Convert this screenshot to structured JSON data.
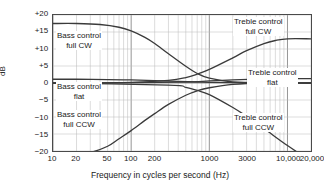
{
  "chart_data": {
    "type": "line",
    "title": "",
    "xlabel": "Frequency in cycles per second (Hz)",
    "ylabel": "dB",
    "xscale": "log",
    "xlim": [
      10,
      20000
    ],
    "ylim": [
      -20,
      20
    ],
    "grid": true,
    "legend_position": "inline-annotations",
    "x_ticks": [
      {
        "value": 10,
        "label": "10"
      },
      {
        "value": 20,
        "label": "20"
      },
      {
        "value": 50,
        "label": "50"
      },
      {
        "value": 100,
        "label": "100"
      },
      {
        "value": 200,
        "label": "200"
      },
      {
        "value": 1000,
        "label": "1000"
      },
      {
        "value": 3000,
        "label": "3000"
      },
      {
        "value": 10000,
        "label": "10,000"
      },
      {
        "value": 20000,
        "label": "20,000"
      }
    ],
    "y_ticks": [
      {
        "value": 20,
        "label": "+20"
      },
      {
        "value": 15,
        "label": "+15"
      },
      {
        "value": 10,
        "label": "+10"
      },
      {
        "value": 5,
        "label": "+5"
      },
      {
        "value": 0,
        "label": "0"
      },
      {
        "value": -5,
        "label": "−5"
      },
      {
        "value": -10,
        "label": "−10"
      },
      {
        "value": -15,
        "label": "−15"
      },
      {
        "value": -20,
        "label": "−20"
      }
    ],
    "series": [
      {
        "name": "Bass control full CW",
        "label_line1": "Bass control",
        "label_line2": "full CW",
        "x": [
          10,
          20,
          40,
          70,
          100,
          150,
          200,
          300,
          500,
          700,
          1000,
          2000,
          5000,
          20000
        ],
        "y": [
          17.5,
          17.5,
          17.2,
          16.4,
          15.3,
          13.4,
          11.6,
          8.6,
          4.9,
          2.8,
          1.4,
          0.3,
          0.0,
          0.0
        ]
      },
      {
        "name": "Bass control flat",
        "label_line1": "Bass control",
        "label_line2": "flat",
        "x": [
          10,
          20,
          50,
          100,
          200,
          400,
          700,
          1000,
          3000,
          20000
        ],
        "y": [
          1.1,
          1.1,
          1.0,
          0.9,
          0.7,
          0.5,
          0.3,
          0.2,
          0.1,
          0.0
        ]
      },
      {
        "name": "Bass control full CCW",
        "label_line1": "Bass control",
        "label_line2": "full CCW",
        "x": [
          10,
          20,
          30,
          50,
          70,
          100,
          150,
          200,
          300,
          500,
          700,
          1000,
          2000,
          5000,
          20000
        ],
        "y": [
          -20.5,
          -20.5,
          -20.4,
          -18.6,
          -16.4,
          -14.0,
          -11.0,
          -9.0,
          -6.3,
          -3.6,
          -2.3,
          -1.4,
          -0.4,
          0.0,
          0.0
        ]
      },
      {
        "name": "Treble control full CW",
        "label_line1": "Treble control",
        "label_line2": "full CW",
        "x": [
          10,
          100,
          300,
          500,
          700,
          1000,
          2000,
          3000,
          5000,
          7000,
          10000,
          20000
        ],
        "y": [
          0.0,
          0.2,
          0.8,
          1.6,
          2.6,
          4.0,
          7.4,
          9.5,
          11.6,
          12.5,
          13.0,
          13.0
        ]
      },
      {
        "name": "Treble control flat",
        "label_line1": "Treble control",
        "label_line2": "flat",
        "x": [
          10,
          100,
          500,
          1000,
          2000,
          5000,
          10000,
          20000
        ],
        "y": [
          0.0,
          0.1,
          0.3,
          0.6,
          0.9,
          1.2,
          1.3,
          1.3
        ]
      },
      {
        "name": "Treble control full CCW",
        "label_line1": "Treble control",
        "label_line2": "full CCW",
        "x": [
          10,
          300,
          500,
          700,
          1000,
          2000,
          3000,
          5000,
          10000,
          15000,
          20000
        ],
        "y": [
          0.0,
          -0.6,
          -1.3,
          -2.2,
          -3.4,
          -7.2,
          -9.8,
          -13.4,
          -18.4,
          -21.0,
          -22.0
        ]
      }
    ],
    "colors": {
      "curve": "#3a3a3a",
      "grid_minor": "#b8b8b8",
      "grid_major": "#7a7a7a",
      "frame": "#4a4a4a",
      "background": "#ffffff",
      "text": "#1a1a1a"
    }
  }
}
